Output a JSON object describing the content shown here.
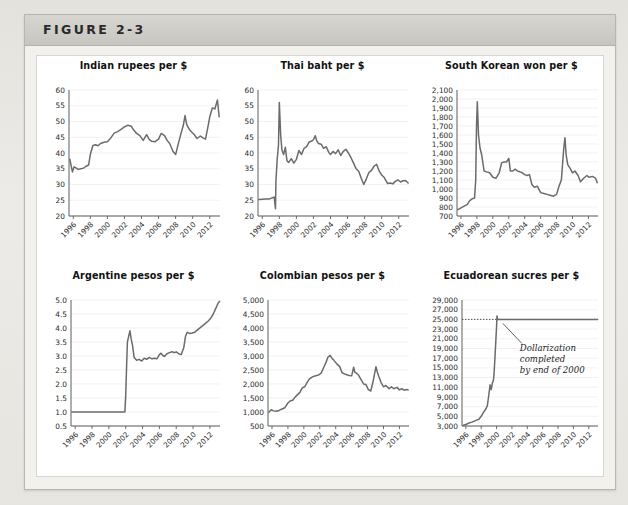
{
  "figure": {
    "label": "FIGURE 2-3",
    "panel_background": "#ffffff",
    "line_color": "#6b6b6b",
    "grid_color": "#ededed",
    "axis_color": "#5d5d5d"
  },
  "chart_data": [
    {
      "id": "indian-rupees",
      "type": "line",
      "title": "Indian rupees per $",
      "xlabel": "",
      "ylabel": "",
      "xlim": [
        1995.5,
        2013.2
      ],
      "ylim": [
        20,
        60
      ],
      "yticks": [
        20,
        25,
        30,
        35,
        40,
        45,
        50,
        55,
        60
      ],
      "ytick_labels": [
        "20",
        "25",
        "30",
        "35",
        "40",
        "45",
        "50",
        "55",
        "60"
      ],
      "xticks": [
        1996,
        1998,
        2000,
        2002,
        2004,
        2006,
        2008,
        2010,
        2012
      ],
      "xtick_labels": [
        "1996",
        "1998",
        "2000",
        "2002",
        "2004",
        "2006",
        "2008",
        "2010",
        "2012"
      ],
      "grid": true,
      "series": [
        {
          "name": "INR per USD",
          "x": [
            1995.6,
            1995.9,
            1996.1,
            1996.3,
            1996.6,
            1996.9,
            1997.2,
            1997.5,
            1997.8,
            1998.0,
            1998.3,
            1998.6,
            1998.9,
            1999.2,
            1999.6,
            2000.0,
            2000.4,
            2000.8,
            2001.2,
            2001.6,
            2002.0,
            2002.4,
            2002.8,
            2003.0,
            2003.4,
            2003.8,
            2004.2,
            2004.6,
            2004.9,
            2005.2,
            2005.6,
            2006.0,
            2006.3,
            2006.7,
            2007.0,
            2007.3,
            2007.7,
            2008.0,
            2008.3,
            2008.6,
            2008.9,
            2009.1,
            2009.3,
            2009.6,
            2009.9,
            2010.2,
            2010.5,
            2010.9,
            2011.2,
            2011.5,
            2011.8,
            2012.0,
            2012.3,
            2012.6,
            2012.9,
            2013.1
          ],
          "y": [
            38.0,
            34.0,
            35.6,
            35.3,
            34.8,
            35.0,
            35.2,
            35.8,
            36.2,
            39.5,
            42.4,
            42.6,
            42.3,
            43.0,
            43.4,
            43.6,
            44.8,
            46.3,
            46.8,
            47.5,
            48.3,
            48.8,
            48.5,
            47.6,
            46.3,
            45.5,
            44.0,
            45.8,
            44.3,
            43.7,
            43.6,
            44.4,
            46.2,
            45.5,
            44.0,
            43.0,
            40.5,
            39.5,
            42.8,
            45.9,
            48.8,
            51.9,
            49.0,
            47.5,
            46.6,
            45.8,
            44.6,
            45.4,
            44.8,
            44.4,
            48.5,
            51.5,
            54.3,
            54.0,
            56.8,
            51.5
          ]
        }
      ]
    },
    {
      "id": "thai-baht",
      "type": "line",
      "title": "Thai baht per $",
      "xlabel": "",
      "ylabel": "",
      "xlim": [
        1995.5,
        2013.2
      ],
      "ylim": [
        20,
        60
      ],
      "yticks": [
        20,
        25,
        30,
        35,
        40,
        45,
        50,
        55,
        60
      ],
      "ytick_labels": [
        "20",
        "25",
        "30",
        "35",
        "40",
        "45",
        "50",
        "55",
        "60"
      ],
      "xticks": [
        1996,
        1998,
        2000,
        2002,
        2004,
        2006,
        2008,
        2010,
        2012
      ],
      "xtick_labels": [
        "1996",
        "1998",
        "2000",
        "2002",
        "2004",
        "2006",
        "2008",
        "2010",
        "2012"
      ],
      "grid": true,
      "series": [
        {
          "name": "THB per USD",
          "x": [
            1995.6,
            1996.0,
            1996.4,
            1996.8,
            1997.0,
            1997.2,
            1997.4,
            1997.55,
            1997.6,
            1997.75,
            1997.9,
            1998.0,
            1998.15,
            1998.3,
            1998.5,
            1998.7,
            1998.9,
            1999.1,
            1999.4,
            1999.7,
            2000.0,
            2000.3,
            2000.6,
            2000.9,
            2001.2,
            2001.5,
            2001.8,
            2002.0,
            2002.2,
            2002.4,
            2002.6,
            2002.9,
            2003.2,
            2003.5,
            2003.8,
            2004.0,
            2004.3,
            2004.6,
            2004.9,
            2005.2,
            2005.5,
            2005.8,
            2006.1,
            2006.4,
            2006.7,
            2007.0,
            2007.3,
            2007.6,
            2007.9,
            2008.2,
            2008.5,
            2008.8,
            2009.1,
            2009.4,
            2009.7,
            2010.0,
            2010.3,
            2010.7,
            2011.0,
            2011.3,
            2011.6,
            2011.9,
            2012.2,
            2012.5,
            2012.8,
            2013.1
          ],
          "y": [
            25.2,
            25.3,
            25.4,
            25.4,
            25.6,
            25.8,
            26.0,
            22.3,
            31.0,
            38.0,
            42.5,
            56.0,
            46.0,
            41.0,
            39.5,
            41.8,
            37.5,
            37.0,
            38.2,
            36.8,
            38.0,
            40.8,
            39.5,
            41.5,
            42.0,
            43.5,
            43.8,
            44.2,
            45.5,
            43.8,
            43.0,
            42.8,
            41.5,
            42.0,
            40.2,
            39.5,
            40.5,
            39.8,
            41.0,
            39.2,
            40.5,
            41.2,
            40.0,
            38.5,
            36.8,
            35.0,
            34.2,
            32.0,
            30.0,
            31.8,
            33.8,
            34.5,
            35.8,
            36.4,
            34.3,
            33.0,
            32.2,
            30.3,
            30.5,
            30.2,
            31.0,
            31.5,
            30.8,
            31.2,
            31.3,
            30.5
          ]
        }
      ]
    },
    {
      "id": "south-korean-won",
      "type": "line",
      "title": "South Korean won per $",
      "xlabel": "",
      "ylabel": "",
      "xlim": [
        1995.5,
        2013.2
      ],
      "ylim": [
        700,
        2100
      ],
      "yticks": [
        700,
        800,
        900,
        1000,
        1100,
        1200,
        1300,
        1400,
        1500,
        1600,
        1700,
        1800,
        1900,
        2000,
        2100
      ],
      "ytick_labels": [
        "700",
        "800",
        "900",
        "1,000",
        "1,100",
        "1,200",
        "1,300",
        "1,400",
        "1,500",
        "1,600",
        "1,700",
        "1,800",
        "1,900",
        "2,000",
        "2,100"
      ],
      "xticks": [
        1996,
        1998,
        2000,
        2002,
        2004,
        2006,
        2008,
        2010,
        2012
      ],
      "xtick_labels": [
        "1996",
        "1998",
        "2000",
        "2002",
        "2004",
        "2006",
        "2008",
        "2010",
        "2012"
      ],
      "grid": true,
      "series": [
        {
          "name": "KRW per USD",
          "x": [
            1995.6,
            1996.0,
            1996.4,
            1996.8,
            1997.1,
            1997.4,
            1997.7,
            1997.85,
            1997.95,
            1998.05,
            1998.2,
            1998.4,
            1998.6,
            1998.9,
            1999.2,
            1999.6,
            2000.0,
            2000.4,
            2000.8,
            2001.1,
            2001.4,
            2001.7,
            2002.0,
            2002.2,
            2002.5,
            2002.8,
            2003.1,
            2003.4,
            2003.7,
            2004.0,
            2004.3,
            2004.6,
            2004.9,
            2005.2,
            2005.6,
            2006.0,
            2006.4,
            2006.8,
            2007.2,
            2007.6,
            2008.0,
            2008.3,
            2008.6,
            2008.9,
            2009.05,
            2009.2,
            2009.4,
            2009.7,
            2010.0,
            2010.3,
            2010.7,
            2011.0,
            2011.4,
            2011.8,
            2012.1,
            2012.5,
            2012.9,
            2013.1
          ],
          "y": [
            770,
            790,
            810,
            830,
            870,
            890,
            900,
            1100,
            1700,
            1970,
            1600,
            1450,
            1380,
            1200,
            1190,
            1180,
            1130,
            1120,
            1180,
            1290,
            1300,
            1300,
            1340,
            1200,
            1200,
            1220,
            1200,
            1190,
            1180,
            1160,
            1150,
            1160,
            1050,
            1020,
            1030,
            960,
            950,
            940,
            930,
            920,
            940,
            1030,
            1100,
            1450,
            1570,
            1380,
            1270,
            1230,
            1180,
            1200,
            1150,
            1080,
            1120,
            1150,
            1130,
            1140,
            1120,
            1070
          ]
        }
      ]
    },
    {
      "id": "argentine-pesos",
      "type": "line",
      "title": "Argentine pesos per $",
      "xlabel": "",
      "ylabel": "",
      "xlim": [
        1995.5,
        2013.2
      ],
      "ylim": [
        0.5,
        5.0
      ],
      "yticks": [
        0.5,
        1.0,
        1.5,
        2.0,
        2.5,
        3.0,
        3.5,
        4.0,
        4.5,
        5.0
      ],
      "ytick_labels": [
        "0.5",
        "1.0",
        "1.5",
        "2.0",
        "2.5",
        "3.0",
        "3.5",
        "4.0",
        "4.5",
        "5.0"
      ],
      "xticks": [
        1996,
        1998,
        2000,
        2002,
        2004,
        2006,
        2008,
        2010,
        2012
      ],
      "xtick_labels": [
        "1996",
        "1998",
        "2000",
        "2002",
        "2004",
        "2006",
        "2008",
        "2010",
        "2012"
      ],
      "grid": true,
      "series": [
        {
          "name": "ARS per USD",
          "x": [
            1995.6,
            1997.0,
            1999.0,
            2001.0,
            2001.5,
            2001.9,
            2002.0,
            2002.1,
            2002.2,
            2002.35,
            2002.5,
            2002.65,
            2002.8,
            2003.0,
            2003.3,
            2003.6,
            2003.9,
            2004.2,
            2004.5,
            2004.8,
            2005.1,
            2005.4,
            2005.7,
            2006.0,
            2006.2,
            2006.4,
            2006.6,
            2006.9,
            2007.2,
            2007.5,
            2007.8,
            2008.0,
            2008.3,
            2008.6,
            2008.9,
            2009.1,
            2009.3,
            2009.6,
            2009.9,
            2010.2,
            2010.6,
            2011.0,
            2011.4,
            2011.8,
            2012.1,
            2012.4,
            2012.7,
            2013.0,
            2013.15
          ],
          "y": [
            1.0,
            1.0,
            1.0,
            1.0,
            1.0,
            1.0,
            1.6,
            2.6,
            3.5,
            3.7,
            3.9,
            3.6,
            3.4,
            2.95,
            2.85,
            2.88,
            2.82,
            2.92,
            2.88,
            2.95,
            2.9,
            2.92,
            2.9,
            3.05,
            3.1,
            3.02,
            2.98,
            3.08,
            3.12,
            3.15,
            3.12,
            3.15,
            3.08,
            3.05,
            3.3,
            3.7,
            3.85,
            3.8,
            3.82,
            3.85,
            3.95,
            4.05,
            4.15,
            4.25,
            4.35,
            4.5,
            4.7,
            4.9,
            4.95
          ]
        }
      ]
    },
    {
      "id": "colombian-pesos",
      "type": "line",
      "title": "Colombian pesos per $",
      "xlabel": "",
      "ylabel": "",
      "xlim": [
        1995.5,
        2013.2
      ],
      "ylim": [
        500,
        5000
      ],
      "yticks": [
        500,
        1000,
        1500,
        2000,
        2500,
        3000,
        3500,
        4000,
        4500,
        5000
      ],
      "ytick_labels": [
        "500",
        "1,000",
        "1,500",
        "2,000",
        "2,500",
        "3,000",
        "3,500",
        "4,000",
        "4,500",
        "5,000"
      ],
      "xticks": [
        1996,
        1998,
        2000,
        2002,
        2004,
        2006,
        2008,
        2010,
        2012
      ],
      "xtick_labels": [
        "1996",
        "1998",
        "2000",
        "2002",
        "2004",
        "2006",
        "2008",
        "2010",
        "2012"
      ],
      "grid": true,
      "series": [
        {
          "name": "COP per USD",
          "x": [
            1995.6,
            1995.9,
            1996.2,
            1996.5,
            1996.9,
            1997.2,
            1997.6,
            1998.0,
            1998.3,
            1998.6,
            1998.9,
            1999.2,
            1999.5,
            1999.8,
            2000.1,
            2000.4,
            2000.7,
            2001.0,
            2001.3,
            2001.6,
            2001.9,
            2002.2,
            2002.5,
            2002.8,
            2003.0,
            2003.3,
            2003.5,
            2003.7,
            2003.9,
            2004.2,
            2004.5,
            2004.8,
            2005.1,
            2005.4,
            2005.7,
            2006.0,
            2006.25,
            2006.4,
            2006.6,
            2006.9,
            2007.2,
            2007.5,
            2007.8,
            2008.1,
            2008.4,
            2008.7,
            2008.9,
            2009.05,
            2009.2,
            2009.4,
            2009.7,
            2010.0,
            2010.3,
            2010.7,
            2011.0,
            2011.3,
            2011.7,
            2012.0,
            2012.3,
            2012.6,
            2012.9,
            2013.1
          ],
          "y": [
            990,
            1080,
            1040,
            1030,
            1055,
            1100,
            1150,
            1320,
            1400,
            1420,
            1530,
            1620,
            1700,
            1860,
            1900,
            2050,
            2180,
            2240,
            2280,
            2300,
            2330,
            2400,
            2600,
            2780,
            2950,
            3020,
            2930,
            2870,
            2800,
            2700,
            2620,
            2400,
            2360,
            2330,
            2300,
            2290,
            2600,
            2420,
            2390,
            2300,
            2150,
            2000,
            1980,
            1800,
            1750,
            2100,
            2400,
            2620,
            2450,
            2280,
            2050,
            1900,
            1950,
            1830,
            1900,
            1830,
            1880,
            1790,
            1830,
            1780,
            1800,
            1790
          ]
        }
      ]
    },
    {
      "id": "ecuadorean-sucres",
      "type": "line",
      "title": "Ecuadorean sucres per $",
      "xlabel": "",
      "ylabel": "",
      "xlim": [
        1995.5,
        2013.2
      ],
      "ylim": [
        3000,
        29000
      ],
      "yticks": [
        3000,
        5000,
        7000,
        9000,
        11000,
        13000,
        15000,
        17000,
        19000,
        21000,
        23000,
        25000,
        27000,
        29000
      ],
      "ytick_labels": [
        "3,000",
        "5,000",
        "7,000",
        "9,000",
        "11,000",
        "13,000",
        "15,000",
        "17,000",
        "19,000",
        "21,000",
        "23,000",
        "25,000",
        "27,000",
        "29,000"
      ],
      "xticks": [
        1996,
        1998,
        2000,
        2002,
        2004,
        2006,
        2008,
        2010,
        2012
      ],
      "xtick_labels": [
        "1996",
        "1998",
        "2000",
        "2002",
        "2004",
        "2006",
        "2008",
        "2010",
        "2012"
      ],
      "grid": true,
      "annotation": {
        "lines": [
          "Dollarization",
          "completed",
          "by end of 2000"
        ],
        "reference_value": 25000
      },
      "series": [
        {
          "name": "ECS per USD",
          "x": [
            1995.6,
            1996.0,
            1996.4,
            1996.8,
            1997.1,
            1997.4,
            1997.7,
            1998.0,
            1998.3,
            1998.6,
            1998.8,
            1999.0,
            1999.15,
            1999.3,
            1999.45,
            1999.6,
            1999.7,
            1999.8,
            1999.9,
            2000.0,
            2000.05,
            2000.15,
            2000.3,
            2000.6,
            2001.0,
            2002.0,
            2003.0,
            2004.0,
            2005.0,
            2006.0,
            2007.0,
            2008.0,
            2009.0,
            2010.0,
            2011.0,
            2012.0,
            2013.15
          ],
          "y": [
            3100,
            3300,
            3600,
            3800,
            4000,
            4200,
            4400,
            5000,
            5800,
            6500,
            7200,
            9500,
            11500,
            10500,
            11800,
            12500,
            14500,
            17500,
            20500,
            23500,
            25700,
            25000,
            25000,
            25000,
            25000,
            25000,
            25000,
            25000,
            25000,
            25000,
            25000,
            25000,
            25000,
            25000,
            25000,
            25000,
            25000
          ]
        }
      ]
    }
  ]
}
